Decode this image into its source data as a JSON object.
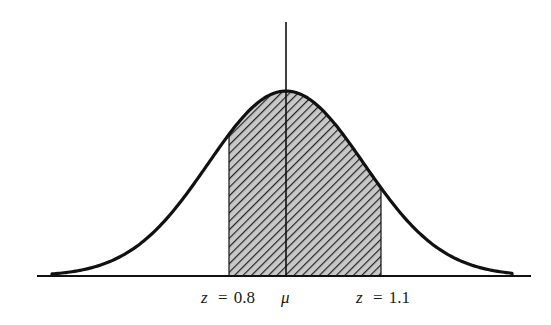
{
  "diagram": {
    "type": "normal-distribution-shaded-area",
    "mean_label": "μ",
    "left_bound": {
      "var": "z",
      "eq": "=",
      "value": "0.8"
    },
    "right_bound": {
      "var": "z",
      "eq": "=",
      "value": "1.1"
    },
    "shading": "diagonal hatching between the two z bounds",
    "colors": {
      "line": "#111111",
      "hatch": "#222222",
      "fill": "#bdbdbd",
      "background": "#ffffff"
    }
  }
}
